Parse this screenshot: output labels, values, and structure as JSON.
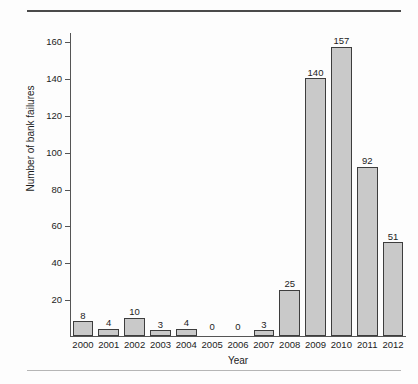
{
  "chart_data": {
    "type": "bar",
    "title": "",
    "xlabel": "Year",
    "ylabel": "Number of bank failures",
    "categories": [
      "2000",
      "2001",
      "2002",
      "2003",
      "2004",
      "2005",
      "2006",
      "2007",
      "2008",
      "2009",
      "2010",
      "2011",
      "2012"
    ],
    "values": [
      8,
      4,
      10,
      3,
      4,
      0,
      0,
      3,
      25,
      140,
      157,
      92,
      51
    ],
    "data_labels": [
      "8",
      "4",
      "10",
      "3",
      "4",
      "0",
      "0",
      "3",
      "25",
      "140",
      "157",
      "92",
      "51"
    ],
    "ylim": [
      0,
      165
    ],
    "yticks": [
      20,
      40,
      60,
      80,
      100,
      120,
      140,
      160
    ],
    "ytick_labels": [
      "20",
      "40",
      "60",
      "80",
      "100",
      "120",
      "140",
      "160"
    ],
    "grid": false,
    "legend": null,
    "bar_fill_color": "#c9c9c9",
    "bar_edge_color": "#3d3d3d",
    "axis_color": "#555555",
    "text_color": "#1c1c1c",
    "background_color": "#fdfdfd"
  },
  "decorations": {
    "top_rule_color": "#4a4a4a",
    "bottom_rule_color": "#b6b6b6"
  }
}
